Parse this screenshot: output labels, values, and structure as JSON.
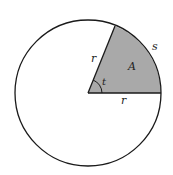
{
  "diagram": {
    "type": "circle-sector",
    "colors": {
      "sector_fill": "#a9a9a9",
      "stroke": "#1a1a1a",
      "background": "#ffffff"
    },
    "labels": {
      "radius_upper": "r",
      "radius_lower": "r",
      "area": "A",
      "arc": "s",
      "angle": "t"
    }
  }
}
